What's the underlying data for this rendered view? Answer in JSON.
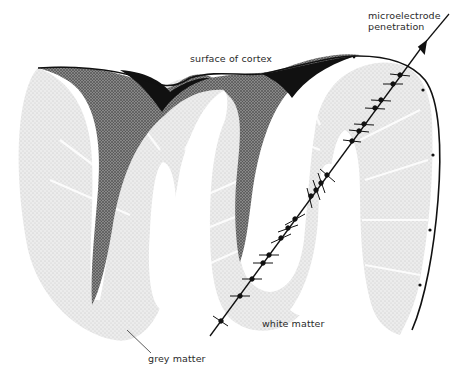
{
  "figure": {
    "labels": {
      "surface": "surface of cortex",
      "electrode_line1": "microelectrode",
      "electrode_line2": "penetration",
      "white_matter": "white matter",
      "grey_matter": "grey matter"
    },
    "colors": {
      "background": "#ffffff",
      "grey_matter": "#e6e6e6",
      "grey_matter_dark": "#d4d4d4",
      "sulcus_fill": "#111111",
      "outline": "#111111",
      "text": "#2a2a2a"
    },
    "electrode": {
      "recording_sites": 16,
      "direction": "down-left diagonal from top-right"
    }
  }
}
